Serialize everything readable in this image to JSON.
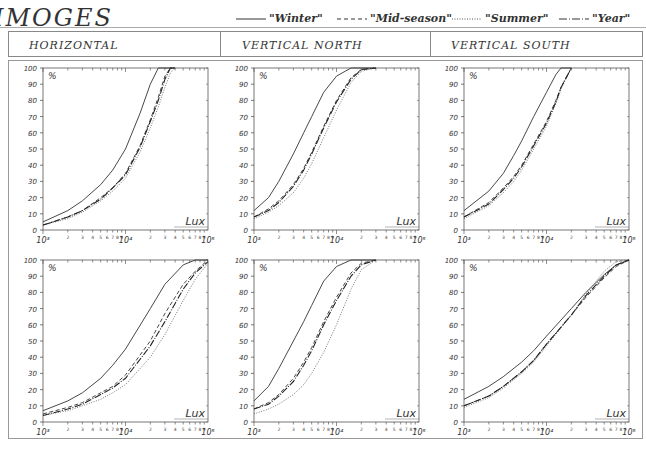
{
  "title": "IMOGES",
  "legend": [
    {
      "label": "\"Winter\"",
      "style": "solid"
    },
    {
      "label": "\"Mid-season\"",
      "style": "dashed"
    },
    {
      "label": "\"Summer\"",
      "style": "dotted"
    },
    {
      "label": "\"Year\"",
      "style": "dashdot"
    }
  ],
  "columns": [
    "HORIZONTAL",
    "VERTICAL NORTH",
    "VERTICAL SOUTH"
  ],
  "axis": {
    "y_label": "%",
    "x_label": "Lux",
    "y_ticks": [
      "0",
      "10",
      "20",
      "30",
      "40",
      "50",
      "60",
      "70",
      "80",
      "90",
      "100"
    ],
    "x_decade_labels": [
      "10³",
      "10⁴",
      "10⁵"
    ],
    "x_minor_labels": [
      "2",
      "3",
      "4",
      "5",
      "6",
      "7",
      "8",
      "9"
    ]
  },
  "chart_data": [
    {
      "type": "line",
      "title": "HORIZONTAL (top)",
      "xlabel": "Lux",
      "ylabel": "%",
      "xscale": "log",
      "xlim": [
        1000,
        100000
      ],
      "ylim": [
        0,
        100
      ],
      "legend_position": "top",
      "x": [
        1000,
        2000,
        3000,
        5000,
        7000,
        10000,
        15000,
        20000,
        25000,
        30000,
        35000,
        40000
      ],
      "series": [
        {
          "name": "Winter",
          "values": [
            5,
            12,
            18,
            28,
            37,
            50,
            72,
            90,
            100,
            100,
            100,
            100
          ]
        },
        {
          "name": "Mid-season",
          "values": [
            3,
            8,
            12,
            20,
            26,
            35,
            52,
            68,
            82,
            95,
            100,
            100
          ]
        },
        {
          "name": "Summer",
          "values": [
            3,
            7,
            11,
            18,
            24,
            32,
            48,
            63,
            76,
            88,
            97,
            100
          ]
        },
        {
          "name": "Year",
          "values": [
            3,
            8,
            12,
            19,
            26,
            34,
            51,
            67,
            80,
            93,
            100,
            100
          ]
        }
      ]
    },
    {
      "type": "line",
      "title": "VERTICAL NORTH (top)",
      "xlabel": "Lux",
      "ylabel": "%",
      "xscale": "log",
      "xlim": [
        1000,
        100000
      ],
      "ylim": [
        0,
        100
      ],
      "x": [
        1000,
        1500,
        2000,
        3000,
        4000,
        5000,
        7000,
        10000,
        15000,
        20000,
        30000
      ],
      "series": [
        {
          "name": "Winter",
          "values": [
            12,
            20,
            30,
            47,
            60,
            70,
            85,
            95,
            100,
            100,
            100
          ]
        },
        {
          "name": "Mid-season",
          "values": [
            8,
            13,
            18,
            28,
            38,
            48,
            64,
            80,
            94,
            99,
            100
          ]
        },
        {
          "name": "Summer",
          "values": [
            7,
            11,
            15,
            23,
            32,
            41,
            57,
            74,
            91,
            98,
            100
          ]
        },
        {
          "name": "Year",
          "values": [
            8,
            12,
            17,
            27,
            37,
            47,
            63,
            79,
            93,
            99,
            100
          ]
        }
      ]
    },
    {
      "type": "line",
      "title": "VERTICAL SOUTH (top)",
      "xlabel": "Lux",
      "ylabel": "%",
      "xscale": "log",
      "xlim": [
        1000,
        100000
      ],
      "ylim": [
        0,
        100
      ],
      "x": [
        1000,
        2000,
        3000,
        4000,
        5000,
        7000,
        10000,
        13000,
        15000,
        20000
      ],
      "series": [
        {
          "name": "Winter",
          "values": [
            12,
            24,
            35,
            46,
            55,
            70,
            85,
            96,
            100,
            100
          ]
        },
        {
          "name": "Mid-season",
          "values": [
            8,
            17,
            26,
            33,
            40,
            53,
            67,
            80,
            88,
            100
          ]
        },
        {
          "name": "Summer",
          "values": [
            7,
            15,
            23,
            30,
            37,
            50,
            64,
            78,
            87,
            100
          ]
        },
        {
          "name": "Year",
          "values": [
            8,
            16,
            25,
            32,
            39,
            52,
            66,
            79,
            88,
            100
          ]
        }
      ]
    },
    {
      "type": "line",
      "title": "HORIZONTAL (bottom)",
      "xlabel": "Lux",
      "ylabel": "%",
      "xscale": "log",
      "xlim": [
        1000,
        100000
      ],
      "ylim": [
        0,
        100
      ],
      "x": [
        1000,
        2000,
        3000,
        5000,
        7000,
        10000,
        20000,
        30000,
        50000,
        70000,
        100000
      ],
      "series": [
        {
          "name": "Winter",
          "values": [
            7,
            13,
            18,
            27,
            35,
            45,
            70,
            85,
            97,
            100,
            100
          ]
        },
        {
          "name": "Mid-season",
          "values": [
            5,
            9,
            12,
            18,
            22,
            29,
            50,
            67,
            85,
            93,
            100
          ]
        },
        {
          "name": "Summer",
          "values": [
            4,
            7,
            10,
            14,
            18,
            23,
            40,
            54,
            75,
            88,
            98
          ]
        },
        {
          "name": "Year",
          "values": [
            4,
            8,
            11,
            17,
            21,
            27,
            47,
            62,
            82,
            92,
            99
          ]
        }
      ]
    },
    {
      "type": "line",
      "title": "VERTICAL NORTH (bottom)",
      "xlabel": "Lux",
      "ylabel": "%",
      "xscale": "log",
      "xlim": [
        1000,
        100000
      ],
      "ylim": [
        0,
        100
      ],
      "x": [
        1000,
        1500,
        2000,
        3000,
        4000,
        5000,
        7000,
        10000,
        15000,
        20000,
        30000
      ],
      "series": [
        {
          "name": "Winter",
          "values": [
            13,
            22,
            33,
            50,
            62,
            72,
            87,
            96,
            100,
            100,
            100
          ]
        },
        {
          "name": "Mid-season",
          "values": [
            8,
            12,
            17,
            27,
            37,
            46,
            62,
            77,
            92,
            98,
            100
          ]
        },
        {
          "name": "Summer",
          "values": [
            5,
            8,
            11,
            17,
            23,
            30,
            43,
            60,
            82,
            94,
            100
          ]
        },
        {
          "name": "Year",
          "values": [
            8,
            11,
            16,
            25,
            35,
            44,
            60,
            75,
            90,
            97,
            100
          ]
        }
      ]
    },
    {
      "type": "line",
      "title": "VERTICAL SOUTH (bottom)",
      "xlabel": "Lux",
      "ylabel": "%",
      "xscale": "log",
      "xlim": [
        1000,
        100000
      ],
      "ylim": [
        0,
        100
      ],
      "x": [
        1000,
        2000,
        3000,
        5000,
        7000,
        10000,
        20000,
        30000,
        50000,
        70000,
        100000
      ],
      "series": [
        {
          "name": "Winter",
          "values": [
            14,
            22,
            28,
            37,
            44,
            53,
            70,
            80,
            91,
            97,
            100
          ]
        },
        {
          "name": "Mid-season",
          "values": [
            10,
            16,
            22,
            31,
            38,
            48,
            66,
            77,
            89,
            96,
            100
          ]
        },
        {
          "name": "Summer",
          "values": [
            9,
            15,
            21,
            30,
            37,
            47,
            66,
            79,
            93,
            99,
            100
          ]
        },
        {
          "name": "Year",
          "values": [
            10,
            16,
            22,
            31,
            38,
            48,
            66,
            78,
            90,
            97,
            100
          ]
        }
      ]
    }
  ],
  "colors": {
    "ink": "#222222",
    "frame": "#888888",
    "background": "#ffffff"
  }
}
